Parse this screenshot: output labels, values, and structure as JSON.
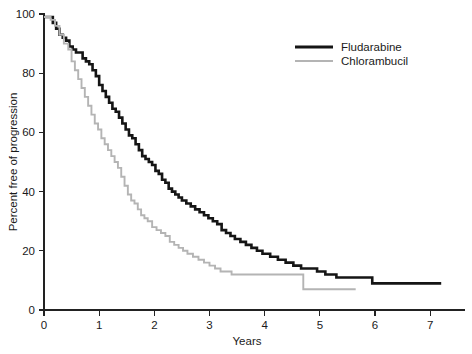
{
  "chart_data": {
    "type": "line",
    "title": "",
    "subtitle": "",
    "xlabel": "Years",
    "ylabel": "Percent free of progression",
    "xlim": [
      0,
      7.45
    ],
    "ylim": [
      0,
      100
    ],
    "xticks": [
      0,
      1,
      2,
      3,
      4,
      5,
      6,
      7
    ],
    "xtick_labels": [
      "0",
      "1",
      "2",
      "3",
      "4",
      "5",
      "6",
      "7"
    ],
    "yticks": [
      0,
      20,
      40,
      60,
      80,
      100
    ],
    "ytick_labels": [
      "0",
      "20",
      "40",
      "60",
      "80",
      "100"
    ],
    "grid": false,
    "legend_position": "top-right",
    "step_plot": true,
    "series": [
      {
        "name": "Fludarabine",
        "color": "#151515",
        "line_width": 2.6,
        "x": [
          0.0,
          0.1,
          0.16,
          0.22,
          0.28,
          0.34,
          0.4,
          0.46,
          0.52,
          0.58,
          0.64,
          0.7,
          0.76,
          0.82,
          0.88,
          0.94,
          1.0,
          1.06,
          1.12,
          1.18,
          1.24,
          1.3,
          1.36,
          1.42,
          1.48,
          1.54,
          1.6,
          1.66,
          1.72,
          1.78,
          1.84,
          1.9,
          1.96,
          2.02,
          2.08,
          2.14,
          2.2,
          2.26,
          2.32,
          2.38,
          2.44,
          2.5,
          2.58,
          2.66,
          2.74,
          2.82,
          2.9,
          2.98,
          3.06,
          3.14,
          3.22,
          3.3,
          3.38,
          3.46,
          3.56,
          3.66,
          3.76,
          3.86,
          3.96,
          4.1,
          4.24,
          4.38,
          4.52,
          4.66,
          4.8,
          4.95,
          5.1,
          5.3,
          5.55,
          5.8,
          5.95,
          6.2,
          6.6,
          7.2
        ],
        "y": [
          99,
          99,
          97,
          95,
          93,
          92,
          91,
          89,
          88,
          87,
          87,
          85,
          84,
          83,
          81,
          79,
          76,
          74,
          72,
          70,
          68,
          67,
          65,
          63,
          61,
          59,
          58,
          56,
          54,
          52,
          51,
          50,
          49,
          47,
          46,
          44,
          43,
          41,
          40,
          39,
          38,
          37,
          36,
          35,
          34,
          33,
          32,
          31,
          30,
          29,
          27,
          26,
          25,
          24,
          23,
          22,
          21,
          20,
          19,
          18,
          17,
          16,
          15,
          14,
          14,
          13,
          12,
          11,
          11,
          11,
          9,
          9,
          9,
          9
        ]
      },
      {
        "name": "Chlorambucil",
        "color": "#b4b4b4",
        "line_width": 1.9,
        "x": [
          0.0,
          0.12,
          0.2,
          0.28,
          0.36,
          0.44,
          0.5,
          0.56,
          0.62,
          0.68,
          0.74,
          0.8,
          0.86,
          0.92,
          0.98,
          1.04,
          1.1,
          1.16,
          1.22,
          1.28,
          1.34,
          1.4,
          1.46,
          1.52,
          1.58,
          1.64,
          1.7,
          1.76,
          1.82,
          1.88,
          1.96,
          2.04,
          2.12,
          2.2,
          2.28,
          2.36,
          2.44,
          2.52,
          2.6,
          2.7,
          2.8,
          2.9,
          3.0,
          3.1,
          3.2,
          3.3,
          3.4,
          3.5,
          4.0,
          4.4,
          4.7,
          5.0,
          5.35,
          5.65
        ],
        "y": [
          99,
          98,
          96,
          93,
          90,
          88,
          84,
          81,
          78,
          75,
          72,
          69,
          66,
          63,
          61,
          58,
          56,
          54,
          52,
          50,
          48,
          45,
          42,
          39,
          37,
          36,
          34,
          32,
          31,
          30,
          28,
          27,
          26,
          25,
          23,
          22,
          21,
          20,
          19,
          18,
          17,
          16,
          15,
          14,
          13,
          13,
          12,
          12,
          12,
          12,
          7,
          7,
          7,
          7
        ]
      }
    ],
    "legend": [
      {
        "label": "Fludarabine",
        "color": "#151515",
        "line_width": 3.0
      },
      {
        "label": "Chlorambucil",
        "color": "#b4b4b4",
        "line_width": 1.9
      }
    ],
    "axis_color": "#222222",
    "background_color": "#ffffff"
  }
}
